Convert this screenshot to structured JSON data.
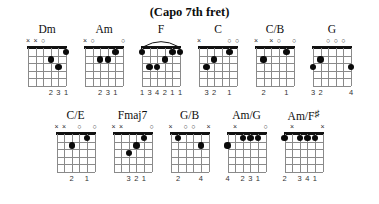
{
  "header": {
    "capo_note": "(Capo 7th fret)"
  },
  "diagram_spec": {
    "strings": 6,
    "frets": 5,
    "string_order_left_to_right": [
      "6",
      "5",
      "4",
      "3",
      "2",
      "1"
    ],
    "marker_glyphs": {
      "muted": "×",
      "open": "○"
    }
  },
  "rows": [
    {
      "row_name": "top-row",
      "chords": [
        {
          "name": "Dm",
          "name_parts": {
            "root": "Dm",
            "accidental": ""
          },
          "markers": [
            {
              "string": 6,
              "type": "muted",
              "glyph": "×"
            },
            {
              "string": 5,
              "type": "muted",
              "glyph": "×"
            },
            {
              "string": 4,
              "type": "open",
              "glyph": "○"
            }
          ],
          "dots": [
            {
              "string": 3,
              "fret": 2
            },
            {
              "string": 2,
              "fret": 3
            },
            {
              "string": 1,
              "fret": 1
            }
          ],
          "barre": null,
          "fingering": [
            {
              "string": 3,
              "label": "2"
            },
            {
              "string": 2,
              "label": "3"
            },
            {
              "string": 1,
              "label": "1"
            }
          ],
          "fingering_text": "231"
        },
        {
          "name": "Am",
          "name_parts": {
            "root": "Am",
            "accidental": ""
          },
          "markers": [
            {
              "string": 6,
              "type": "muted",
              "glyph": "×"
            },
            {
              "string": 5,
              "type": "open",
              "glyph": "○"
            },
            {
              "string": 1,
              "type": "open",
              "glyph": "○"
            }
          ],
          "dots": [
            {
              "string": 4,
              "fret": 2
            },
            {
              "string": 3,
              "fret": 2
            },
            {
              "string": 2,
              "fret": 1
            }
          ],
          "barre": null,
          "fingering": [
            {
              "string": 4,
              "label": "2"
            },
            {
              "string": 3,
              "label": "3"
            },
            {
              "string": 2,
              "label": "1"
            }
          ],
          "fingering_text": "231"
        },
        {
          "name": "F",
          "name_parts": {
            "root": "F",
            "accidental": ""
          },
          "markers": [],
          "dots": [
            {
              "string": 6,
              "fret": 1
            },
            {
              "string": 5,
              "fret": 3
            },
            {
              "string": 4,
              "fret": 3
            },
            {
              "string": 3,
              "fret": 2
            },
            {
              "string": 2,
              "fret": 1
            },
            {
              "string": 1,
              "fret": 1
            }
          ],
          "barre": {
            "fret": 1,
            "from_string": 6,
            "to_string": 1
          },
          "fingering": [
            {
              "string": 6,
              "label": "1"
            },
            {
              "string": 5,
              "label": "3"
            },
            {
              "string": 4,
              "label": "4"
            },
            {
              "string": 3,
              "label": "2"
            },
            {
              "string": 2,
              "label": "1"
            },
            {
              "string": 1,
              "label": "1"
            }
          ],
          "fingering_text": "134211"
        },
        {
          "name": "C",
          "name_parts": {
            "root": "C",
            "accidental": ""
          },
          "markers": [
            {
              "string": 6,
              "type": "muted",
              "glyph": "×"
            },
            {
              "string": 2,
              "type": "open",
              "glyph": "○"
            },
            {
              "string": 1,
              "type": "open",
              "glyph": "○"
            }
          ],
          "dots": [
            {
              "string": 5,
              "fret": 3
            },
            {
              "string": 4,
              "fret": 2
            },
            {
              "string": 2,
              "fret": 1
            }
          ],
          "barre": null,
          "fingering": [
            {
              "string": 5,
              "label": "3"
            },
            {
              "string": 4,
              "label": "2"
            },
            {
              "string": 2,
              "label": "1"
            }
          ],
          "fingering_text": "32 1"
        },
        {
          "name": "C/B",
          "name_parts": {
            "root": "C/B",
            "accidental": ""
          },
          "markers": [
            {
              "string": 6,
              "type": "muted",
              "glyph": "×"
            },
            {
              "string": 4,
              "type": "muted",
              "glyph": "×"
            },
            {
              "string": 3,
              "type": "open",
              "glyph": "○"
            },
            {
              "string": 1,
              "type": "open",
              "glyph": "○"
            }
          ],
          "dots": [
            {
              "string": 5,
              "fret": 2
            },
            {
              "string": 2,
              "fret": 1
            }
          ],
          "barre": null,
          "fingering": [
            {
              "string": 5,
              "label": "2"
            },
            {
              "string": 2,
              "label": "1"
            }
          ],
          "fingering_text": "2 1"
        },
        {
          "name": "G",
          "name_parts": {
            "root": "G",
            "accidental": ""
          },
          "markers": [
            {
              "string": 4,
              "type": "open",
              "glyph": "○"
            },
            {
              "string": 3,
              "type": "open",
              "glyph": "○"
            },
            {
              "string": 2,
              "type": "open",
              "glyph": "○"
            }
          ],
          "dots": [
            {
              "string": 6,
              "fret": 3
            },
            {
              "string": 5,
              "fret": 2
            },
            {
              "string": 1,
              "fret": 3
            }
          ],
          "barre": null,
          "fingering": [
            {
              "string": 6,
              "label": "3"
            },
            {
              "string": 5,
              "label": "2"
            },
            {
              "string": 1,
              "label": "4"
            }
          ],
          "fingering_text": "32 4"
        }
      ]
    },
    {
      "row_name": "bottom-row",
      "chords": [
        {
          "name": "C/E",
          "name_parts": {
            "root": "C/E",
            "accidental": ""
          },
          "markers": [
            {
              "string": 6,
              "type": "muted",
              "glyph": "×"
            },
            {
              "string": 5,
              "type": "muted",
              "glyph": "×"
            },
            {
              "string": 3,
              "type": "open",
              "glyph": "○"
            },
            {
              "string": 1,
              "type": "open",
              "glyph": "○"
            }
          ],
          "dots": [
            {
              "string": 4,
              "fret": 2
            },
            {
              "string": 2,
              "fret": 1
            }
          ],
          "barre": null,
          "fingering": [
            {
              "string": 4,
              "label": "2"
            },
            {
              "string": 2,
              "label": "1"
            }
          ],
          "fingering_text": "2 1"
        },
        {
          "name": "Fmaj7",
          "name_parts": {
            "root": "Fmaj7",
            "accidental": ""
          },
          "markers": [
            {
              "string": 6,
              "type": "muted",
              "glyph": "×"
            },
            {
              "string": 5,
              "type": "muted",
              "glyph": "×"
            },
            {
              "string": 1,
              "type": "open",
              "glyph": "○"
            }
          ],
          "dots": [
            {
              "string": 4,
              "fret": 3
            },
            {
              "string": 3,
              "fret": 2
            },
            {
              "string": 2,
              "fret": 1
            }
          ],
          "barre": null,
          "fingering": [
            {
              "string": 4,
              "label": "3"
            },
            {
              "string": 3,
              "label": "2"
            },
            {
              "string": 2,
              "label": "1"
            }
          ],
          "fingering_text": "321"
        },
        {
          "name": "G/B",
          "name_parts": {
            "root": "G/B",
            "accidental": ""
          },
          "markers": [
            {
              "string": 6,
              "type": "muted",
              "glyph": "×"
            },
            {
              "string": 4,
              "type": "open",
              "glyph": "○"
            },
            {
              "string": 3,
              "type": "open",
              "glyph": "○"
            },
            {
              "string": 1,
              "type": "muted",
              "glyph": "×"
            }
          ],
          "dots": [
            {
              "string": 5,
              "fret": 1
            },
            {
              "string": 2,
              "fret": 2
            }
          ],
          "barre": null,
          "fingering": [
            {
              "string": 5,
              "label": "2"
            },
            {
              "string": 2,
              "label": "4"
            }
          ],
          "fingering_text": "2 4"
        },
        {
          "name": "Am/G",
          "name_parts": {
            "root": "Am/G",
            "accidental": ""
          },
          "markers": [
            {
              "string": 5,
              "type": "muted",
              "glyph": "×"
            },
            {
              "string": 1,
              "type": "open",
              "glyph": "○"
            }
          ],
          "dots": [
            {
              "string": 6,
              "fret": 2
            },
            {
              "string": 4,
              "fret": 1
            },
            {
              "string": 3,
              "fret": 1
            },
            {
              "string": 2,
              "fret": 1
            }
          ],
          "barre": null,
          "fingering": [
            {
              "string": 6,
              "label": "4"
            },
            {
              "string": 4,
              "label": "2"
            },
            {
              "string": 3,
              "label": "3"
            },
            {
              "string": 2,
              "label": "1"
            }
          ],
          "fingering_text": "4 231"
        },
        {
          "name": "Am/F#",
          "name_parts": {
            "root": "Am/F",
            "accidental": "♯"
          },
          "markers": [
            {
              "string": 5,
              "type": "muted",
              "glyph": "×"
            },
            {
              "string": 1,
              "type": "muted",
              "glyph": "×"
            }
          ],
          "dots": [
            {
              "string": 6,
              "fret": 1
            },
            {
              "string": 4,
              "fret": 1
            },
            {
              "string": 3,
              "fret": 1
            },
            {
              "string": 2,
              "fret": 1
            }
          ],
          "barre": null,
          "fingering": [
            {
              "string": 6,
              "label": "2"
            },
            {
              "string": 4,
              "label": "3"
            },
            {
              "string": 3,
              "label": "4"
            },
            {
              "string": 2,
              "label": "1"
            }
          ],
          "fingering_text": "2 341"
        }
      ]
    }
  ],
  "colors": {
    "ink": "#0d0d0d",
    "grid_line": "#8a8a8a",
    "nut": "#111111",
    "dot": "#0a0a0a",
    "background": "#ffffff"
  }
}
